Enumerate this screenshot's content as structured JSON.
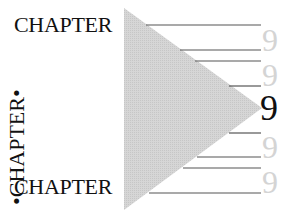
{
  "graphic": {
    "top_word": "CHAPTER",
    "bottom_word": "CHAPTER",
    "vertical_text": "•CHAPTER•",
    "numbers": [
      {
        "label": "9",
        "style": "faded"
      },
      {
        "label": "9",
        "style": "faded"
      },
      {
        "label": "9",
        "style": "dark"
      },
      {
        "label": "9",
        "style": "faded"
      },
      {
        "label": "9",
        "style": "faded"
      }
    ],
    "colors": {
      "text": "#111111",
      "faded_number": "#d4d4d4",
      "triangle_fill": "#d0d0d0",
      "rule": "#555555"
    }
  }
}
